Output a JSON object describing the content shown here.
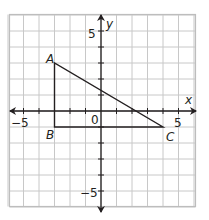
{
  "diagram": {
    "type": "coordinate-plane",
    "x_range": [
      -6,
      6
    ],
    "y_range": [
      -6,
      6
    ],
    "axis_labels": {
      "x": "x",
      "y": "y"
    },
    "tick_labels": {
      "x_neg": "−5",
      "x_pos": "5",
      "y_pos": "5",
      "y_neg": "−5",
      "origin": "0"
    },
    "triangle": {
      "vertices": [
        {
          "label": "A",
          "x": -3,
          "y": 3
        },
        {
          "label": "B",
          "x": -3,
          "y": -1
        },
        {
          "label": "C",
          "x": 4,
          "y": -1
        }
      ]
    },
    "colors": {
      "grid": "#c8c8c8",
      "axis": "#231f20",
      "shape": "#231f20",
      "background": "#ffffff"
    }
  }
}
